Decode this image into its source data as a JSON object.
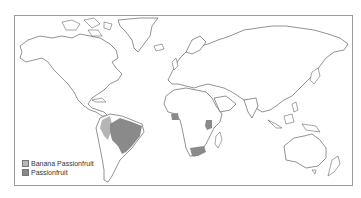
{
  "map": {
    "type": "world distribution map",
    "frame_color": "#9a9a9a",
    "outline_color": "#4a4a4a"
  },
  "legend": {
    "items": [
      {
        "label": "Banana Passionfruit",
        "color": "#b5b5b5"
      },
      {
        "label": "Passionfruit",
        "color": "#8a8a8a"
      }
    ]
  },
  "regions": [
    {
      "name": "Andean northwest South America",
      "legend": "Banana Passionfruit",
      "color": "#b5b5b5"
    },
    {
      "name": "Brazil / Paraguay / northern Argentina",
      "legend": "Passionfruit",
      "color": "#8a8a8a"
    },
    {
      "name": "West Africa (Ghana/Nigeria area)",
      "legend": "Passionfruit",
      "color": "#8a8a8a"
    },
    {
      "name": "East Africa (Kenya/Uganda area)",
      "legend": "Passionfruit",
      "color": "#8a8a8a"
    },
    {
      "name": "South Africa",
      "legend": "Passionfruit",
      "color": "#8a8a8a"
    }
  ]
}
